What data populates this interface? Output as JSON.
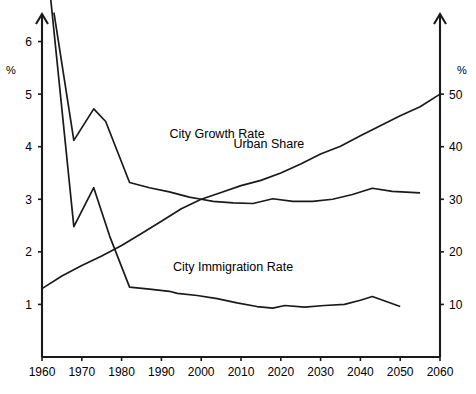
{
  "chart_data": {
    "type": "line",
    "title": "",
    "xlabel": "",
    "ylabel": "%",
    "y2label": "%",
    "grid": false,
    "legend_position": "inline-annotations",
    "xlim": [
      1960,
      2060
    ],
    "xticks": [
      1960,
      1970,
      1980,
      1990,
      2000,
      2010,
      2020,
      2030,
      2040,
      2050,
      2060
    ],
    "xtick_labels": [
      "1960",
      "1970",
      "1980",
      "1990",
      "2000",
      "2010",
      "2020",
      "2030",
      "2040",
      "2050",
      "2060"
    ],
    "ylim": [
      0,
      6.6
    ],
    "yticks": [
      1,
      2,
      3,
      4,
      5,
      6
    ],
    "ytick_labels": [
      "1",
      "2",
      "3",
      "4",
      "5",
      "6"
    ],
    "y2lim": [
      0,
      66
    ],
    "y2ticks": [
      10,
      20,
      30,
      40,
      50
    ],
    "y2tick_labels": [
      "10",
      "20",
      "30",
      "40",
      "50"
    ],
    "series": [
      {
        "name": "City Growth Rate",
        "axis": "left",
        "label_x": 2004,
        "label_y": 4.25,
        "x": [
          1963,
          1968,
          1973,
          1976,
          1982,
          1987,
          1992,
          1997,
          2000,
          2003,
          2008,
          2013,
          2018,
          2023,
          2028,
          2033,
          2038,
          2043,
          2048,
          2055
        ],
        "y": [
          6.55,
          4.12,
          4.72,
          4.48,
          3.32,
          3.22,
          3.14,
          3.04,
          3.0,
          2.96,
          2.93,
          2.92,
          3.01,
          2.96,
          2.96,
          3.0,
          3.09,
          3.21,
          3.15,
          3.12
        ]
      },
      {
        "name": "City Immigration Rate",
        "axis": "left",
        "label_x": 2008,
        "label_y": 1.72,
        "x": [
          1962,
          1968,
          1973,
          1977,
          1982,
          1987,
          1992,
          1994,
          1999,
          2004,
          2009,
          2014,
          2018,
          2021,
          2026,
          2031,
          2036,
          2040,
          2043,
          2050
        ],
        "y": [
          6.95,
          2.48,
          3.22,
          2.3,
          1.33,
          1.29,
          1.25,
          1.21,
          1.17,
          1.11,
          1.03,
          0.96,
          0.93,
          0.98,
          0.95,
          0.98,
          1.0,
          1.08,
          1.15,
          0.96
        ]
      },
      {
        "name": "Urban Share",
        "axis": "right",
        "label_x": 2017,
        "label_y": 40.5,
        "x": [
          1960,
          1965,
          1970,
          1975,
          1980,
          1985,
          1990,
          1995,
          2000,
          2005,
          2010,
          2015,
          2020,
          2025,
          2030,
          2035,
          2040,
          2045,
          2050,
          2055,
          2060
        ],
        "y": [
          13.0,
          15.4,
          17.4,
          19.2,
          21.2,
          23.5,
          25.8,
          28.2,
          30.0,
          31.3,
          32.6,
          33.6,
          35.0,
          36.7,
          38.6,
          40.1,
          42.1,
          44.0,
          45.9,
          47.6,
          50.0
        ]
      }
    ],
    "annotations": [
      {
        "text": "City Growth Rate"
      },
      {
        "text": "City Immigration Rate"
      },
      {
        "text": "Urban Share"
      }
    ]
  }
}
